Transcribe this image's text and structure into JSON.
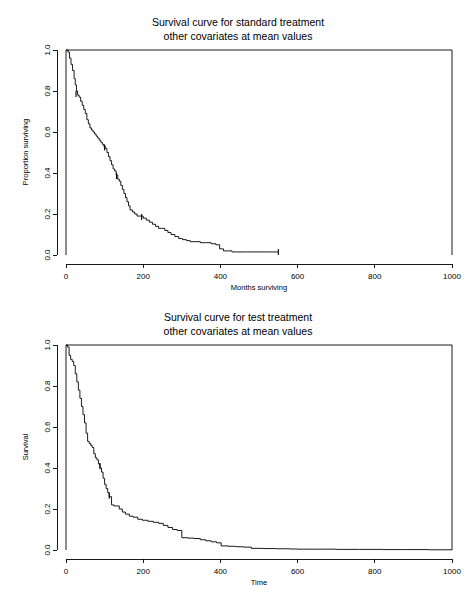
{
  "page": {
    "background_color": "#ffffff",
    "ink_color": "#000000",
    "width": 476,
    "height": 593
  },
  "chart_data": [
    {
      "id": "standard-treatment",
      "type": "line",
      "subtype": "kaplan-meier-step",
      "title": "Survival curve for standard treatment",
      "subtitle": "other covariates at mean values",
      "xlabel": "Months surviving",
      "ylabel": "Proportion surviving",
      "xlim": [
        0,
        1000
      ],
      "ylim": [
        0.0,
        1.0
      ],
      "xticks": [
        0,
        200,
        400,
        600,
        800,
        1000
      ],
      "xticklabels": [
        "0",
        "200",
        "400",
        "600",
        "800",
        "1000"
      ],
      "yticks": [
        0.0,
        0.2,
        0.4,
        0.6,
        0.8,
        1.0
      ],
      "yticklabels": [
        "0.0",
        "0.2",
        "0.4",
        "0.6",
        "0.8",
        "1.0"
      ],
      "grid": false,
      "legend": null,
      "series_name": "Standard treatment survival",
      "x": [
        0,
        5,
        9,
        13,
        17,
        21,
        24,
        27,
        30,
        34,
        38,
        42,
        46,
        50,
        54,
        58,
        62,
        66,
        70,
        74,
        78,
        82,
        86,
        90,
        94,
        98,
        102,
        106,
        110,
        114,
        118,
        122,
        126,
        130,
        134,
        138,
        142,
        146,
        150,
        154,
        158,
        162,
        166,
        172,
        178,
        184,
        192,
        200,
        208,
        216,
        224,
        232,
        240,
        248,
        256,
        264,
        272,
        282,
        292,
        302,
        312,
        322,
        334,
        348,
        362,
        376,
        388,
        398,
        408,
        430,
        470,
        520,
        550
      ],
      "y": [
        1.0,
        0.99,
        0.96,
        0.93,
        0.9,
        0.86,
        0.83,
        0.8,
        0.78,
        0.77,
        0.75,
        0.73,
        0.71,
        0.69,
        0.66,
        0.64,
        0.62,
        0.61,
        0.6,
        0.59,
        0.58,
        0.57,
        0.56,
        0.55,
        0.54,
        0.53,
        0.52,
        0.5,
        0.48,
        0.46,
        0.44,
        0.42,
        0.41,
        0.39,
        0.37,
        0.36,
        0.34,
        0.32,
        0.3,
        0.28,
        0.26,
        0.24,
        0.22,
        0.21,
        0.2,
        0.19,
        0.19,
        0.18,
        0.17,
        0.16,
        0.15,
        0.14,
        0.13,
        0.13,
        0.12,
        0.11,
        0.1,
        0.09,
        0.08,
        0.075,
        0.07,
        0.065,
        0.065,
        0.06,
        0.06,
        0.055,
        0.05,
        0.03,
        0.02,
        0.015,
        0.015,
        0.015,
        0.015
      ],
      "censored_points": [
        {
          "x": 26,
          "y": 0.785
        },
        {
          "x": 100,
          "y": 0.525
        },
        {
          "x": 131,
          "y": 0.385
        },
        {
          "x": 196,
          "y": 0.185
        }
      ],
      "curve_end_x": 550,
      "annotations": []
    },
    {
      "id": "test-treatment",
      "type": "line",
      "subtype": "kaplan-meier-step",
      "title": "Survival curve for test treatment",
      "subtitle": "other covariates at mean values",
      "xlabel": "Time",
      "ylabel": "Survival",
      "xlim": [
        0,
        1000
      ],
      "ylim": [
        0.0,
        1.0
      ],
      "xticks": [
        0,
        200,
        400,
        600,
        800,
        1000
      ],
      "xticklabels": [
        "0",
        "200",
        "400",
        "600",
        "800",
        "1000"
      ],
      "yticks": [
        0.0,
        0.2,
        0.4,
        0.6,
        0.8,
        1.0
      ],
      "yticklabels": [
        "0.0",
        "0.2",
        "0.4",
        "0.6",
        "0.8",
        "1.0"
      ],
      "grid": false,
      "legend": null,
      "series_name": "Test treatment survival",
      "x": [
        0,
        4,
        8,
        12,
        16,
        20,
        24,
        28,
        32,
        36,
        40,
        44,
        48,
        52,
        56,
        60,
        64,
        68,
        72,
        76,
        80,
        84,
        88,
        92,
        96,
        100,
        104,
        108,
        112,
        118,
        124,
        130,
        138,
        146,
        154,
        164,
        174,
        186,
        198,
        212,
        226,
        240,
        252,
        264,
        276,
        288,
        300,
        316,
        332,
        348,
        362,
        376,
        390,
        402,
        420,
        440,
        460,
        480,
        510,
        545,
        580,
        600,
        650,
        700,
        760,
        820,
        880,
        940,
        1000
      ],
      "y": [
        1.0,
        0.99,
        0.95,
        0.93,
        0.92,
        0.9,
        0.86,
        0.82,
        0.78,
        0.74,
        0.7,
        0.66,
        0.62,
        0.57,
        0.53,
        0.52,
        0.51,
        0.5,
        0.47,
        0.45,
        0.44,
        0.42,
        0.4,
        0.38,
        0.35,
        0.32,
        0.3,
        0.28,
        0.26,
        0.22,
        0.215,
        0.215,
        0.2,
        0.185,
        0.175,
        0.165,
        0.16,
        0.15,
        0.145,
        0.14,
        0.135,
        0.13,
        0.12,
        0.11,
        0.1,
        0.095,
        0.06,
        0.058,
        0.056,
        0.05,
        0.045,
        0.04,
        0.035,
        0.02,
        0.018,
        0.016,
        0.014,
        0.008,
        0.007,
        0.006,
        0.005,
        0.004,
        0.004,
        0.003,
        0.003,
        0.002,
        0.002,
        0.001,
        0.001
      ],
      "censored_points": [
        {
          "x": 88,
          "y": 0.41
        },
        {
          "x": 112,
          "y": 0.265
        }
      ],
      "curve_end_x": 1000,
      "annotations": []
    }
  ]
}
